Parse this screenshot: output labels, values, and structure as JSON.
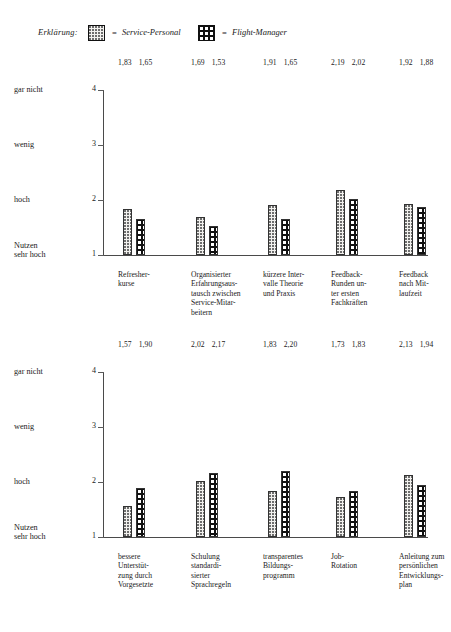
{
  "legend": {
    "title": "Erklärung:",
    "equals": "=",
    "series": [
      {
        "key": "service-personal",
        "label": "Service-Personal",
        "swatch": "dotted-light"
      },
      {
        "key": "flight-manager",
        "label": "Flight-Manager",
        "swatch": "black-dotted"
      }
    ]
  },
  "axis": {
    "ticks": [
      {
        "value": 4,
        "label": "gar nicht"
      },
      {
        "value": 3,
        "label": "wenig"
      },
      {
        "value": 2,
        "label": "hoch"
      },
      {
        "value": 1,
        "label": "Nutzen\nsehr hoch"
      }
    ],
    "tick_numbers": [
      "4",
      "3",
      "2",
      "1"
    ],
    "tick_texts": [
      "gar nicht",
      "wenig",
      "hoch",
      "Nutzen",
      "sehr hoch"
    ]
  },
  "chart_data": [
    {
      "type": "bar",
      "title": "",
      "xlabel": "",
      "ylabel": "",
      "ylim": [
        1,
        4
      ],
      "grid": false,
      "legend_position": "top",
      "categories": [
        "Refresher-\nkurse",
        "Organisierter\nErfahrungsaus-\ntausch zwischen\nService-Mitar-\nbeitern",
        "kürzere Inter-\nvalle Theorie\nund Praxis",
        "Feedback-\nRunden un-\nter ersten\nFachkräften",
        "Feedback\nnach Mit-\nlaufzeit"
      ],
      "category_lines": [
        [
          "Refresher-",
          "kurse"
        ],
        [
          "Organisierter",
          "Erfahrungsaus-",
          "tausch zwischen",
          "Service-Mitar-",
          "beitern"
        ],
        [
          "kürzere Inter-",
          "valle Theorie",
          "und Praxis"
        ],
        [
          "Feedback-",
          "Runden un-",
          "ter ersten",
          "Fachkräften"
        ],
        [
          "Feedback",
          "nach Mit-",
          "laufzeit"
        ]
      ],
      "series": [
        {
          "name": "Service-Personal",
          "values": [
            1.83,
            1.69,
            1.91,
            2.19,
            1.92
          ],
          "labels": [
            "1,83",
            "1,69",
            "1,91",
            "2,19",
            "1,92"
          ]
        },
        {
          "name": "Flight-Manager",
          "values": [
            1.65,
            1.53,
            1.65,
            2.02,
            1.88
          ],
          "labels": [
            "1,65",
            "1,53",
            "1,65",
            "2,02",
            "1,88"
          ]
        }
      ]
    },
    {
      "type": "bar",
      "title": "",
      "xlabel": "",
      "ylabel": "",
      "ylim": [
        1,
        4
      ],
      "grid": false,
      "legend_position": "top",
      "categories": [
        "bessere\nUnterstüt-\nzung durch\nVorgesetzte",
        "Schulung\nstandardi-\nsierter\nSprachregeln",
        "transparentes\nBildungs-\nprogramm",
        "Job-\nRotation",
        "Anleitung zum\npersönlichen\nEntwicklungs-\nplan"
      ],
      "category_lines": [
        [
          "bessere",
          "Unterstüt-",
          "zung durch",
          "Vorgesetzte"
        ],
        [
          "Schulung",
          "standardi-",
          "sierter",
          "Sprachregeln"
        ],
        [
          "transparentes",
          "Bildungs-",
          "programm"
        ],
        [
          "Job-",
          "Rotation"
        ],
        [
          "Anleitung zum",
          "persönlichen",
          "Entwicklungs-",
          "plan"
        ]
      ],
      "series": [
        {
          "name": "Service-Personal",
          "values": [
            1.57,
            2.02,
            1.83,
            1.73,
            2.13
          ],
          "labels": [
            "1,57",
            "2,02",
            "1,83",
            "1,73",
            "2,13"
          ]
        },
        {
          "name": "Flight-Manager",
          "values": [
            1.9,
            2.17,
            2.2,
            1.83,
            1.94
          ],
          "labels": [
            "1,90",
            "2,17",
            "2,20",
            "1,83",
            "1,94"
          ]
        }
      ]
    }
  ],
  "colors": {
    "axis": "#4a4a4a",
    "text": "#1a1a1a",
    "series_service_personal": "#f2f1ee",
    "series_flight_manager": "#111111"
  }
}
